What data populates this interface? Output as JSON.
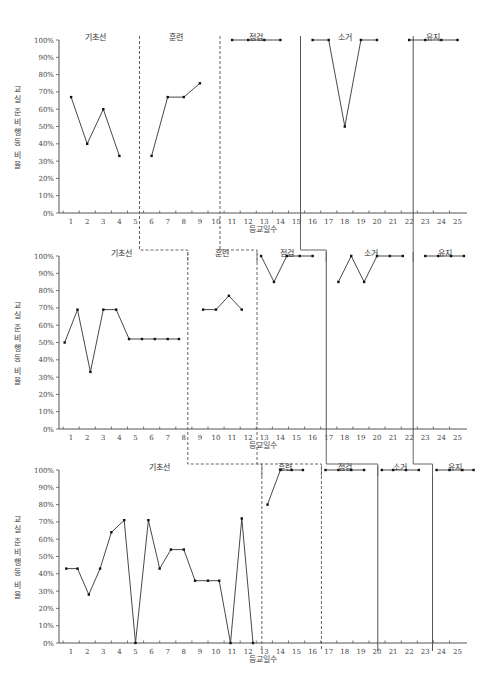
{
  "chart_data": [
    {
      "type": "line",
      "title": "",
      "ylabel": "교실 준비행동 비율",
      "xlabel": "등교일수",
      "ylim": [
        0,
        100
      ],
      "yticks": [
        "0%",
        "10%",
        "20%",
        "30%",
        "40%",
        "50%",
        "60%",
        "70%",
        "80%",
        "90%",
        "100%"
      ],
      "xticks": [
        1,
        2,
        3,
        4,
        5,
        6,
        7,
        8,
        9,
        10,
        11,
        12,
        13,
        14,
        15,
        16,
        17,
        18,
        19,
        20,
        21,
        22,
        23,
        24,
        25
      ],
      "phases": [
        {
          "label": "기초선",
          "x": [
            1,
            2,
            3,
            4
          ],
          "values": [
            67,
            40,
            60,
            33
          ]
        },
        {
          "label": "훈련",
          "x": [
            6,
            7,
            8,
            9
          ],
          "values": [
            33,
            67,
            67,
            75
          ]
        },
        {
          "label": "점검",
          "x": [
            11,
            12,
            13,
            14
          ],
          "values": [
            100,
            100,
            100,
            100
          ]
        },
        {
          "label": "소거",
          "x": [
            16,
            17,
            18,
            19,
            20
          ],
          "values": [
            100,
            100,
            50,
            100,
            100
          ]
        },
        {
          "label": "유지",
          "x": [
            22,
            23,
            24,
            25
          ],
          "values": [
            100,
            100,
            100,
            100
          ]
        }
      ],
      "phase_boundaries": [
        5,
        10,
        15,
        22
      ]
    },
    {
      "type": "line",
      "title": "",
      "ylabel": "교실 준비행동 비율",
      "xlabel": "등교일수",
      "ylim": [
        0,
        100
      ],
      "yticks": [
        "0%",
        "10%",
        "20%",
        "30%",
        "40%",
        "50%",
        "60%",
        "70%",
        "80%",
        "90%",
        "100%"
      ],
      "xticks": [
        1,
        2,
        3,
        4,
        5,
        6,
        7,
        8,
        9,
        10,
        11,
        12,
        13,
        14,
        15,
        16,
        17,
        18,
        19,
        20,
        21,
        22,
        23,
        24,
        25
      ],
      "phases": [
        {
          "label": "기초선",
          "x": [
            0.6,
            1.4,
            2.2,
            3.0,
            3.8,
            4.6,
            5.4,
            6.2,
            7.0,
            7.7
          ],
          "values": [
            50,
            69,
            33,
            69,
            69,
            52,
            52,
            52,
            52,
            52
          ]
        },
        {
          "label": "훈련",
          "x": [
            9.2,
            10.0,
            10.8,
            11.6
          ],
          "values": [
            69,
            69,
            77,
            69
          ]
        },
        {
          "label": "점검",
          "x": [
            12.8,
            13.6,
            14.4,
            15.2,
            16.0
          ],
          "values": [
            100,
            85,
            100,
            100,
            100
          ]
        },
        {
          "label": "소거",
          "x": [
            17.6,
            18.4,
            19.2,
            20.0,
            20.8,
            21.6
          ],
          "values": [
            85,
            100,
            85,
            100,
            100,
            100
          ]
        },
        {
          "label": "유지",
          "x": [
            23.0,
            23.8,
            24.6,
            25.4
          ],
          "values": [
            100,
            100,
            100,
            100
          ]
        }
      ],
      "phase_boundaries": [
        8,
        12.3,
        16.6,
        22
      ]
    },
    {
      "type": "line",
      "title": "",
      "ylabel": "교실 준비행동 비율",
      "xlabel": "등교일수",
      "ylim": [
        0,
        100
      ],
      "yticks": [
        "0%",
        "10%",
        "20%",
        "30%",
        "40%",
        "50%",
        "60%",
        "70%",
        "80%",
        "90%",
        "100%"
      ],
      "xticks": [
        1,
        2,
        3,
        4,
        5,
        6,
        7,
        8,
        9,
        10,
        11,
        12,
        13,
        14,
        15,
        16,
        17,
        18,
        19,
        20,
        21,
        22,
        23,
        24,
        25
      ],
      "phases": [
        {
          "label": "기초선",
          "x": [
            0.7,
            1.4,
            2.1,
            2.8,
            3.5,
            4.3,
            5.0,
            5.8,
            6.5,
            7.2,
            8.0,
            8.7,
            9.5,
            10.2,
            10.9,
            11.6,
            12.3
          ],
          "values": [
            43,
            43,
            28,
            43,
            64,
            71,
            0,
            71,
            43,
            54,
            54,
            36,
            36,
            36,
            0,
            72,
            0
          ]
        },
        {
          "label": "훈련",
          "x": [
            13.2,
            14.0,
            14.7,
            15.4
          ],
          "values": [
            80,
            100,
            100,
            100
          ]
        },
        {
          "label": "점검",
          "x": [
            16.8,
            17.6,
            18.4,
            19.2
          ],
          "values": [
            100,
            100,
            100,
            100
          ]
        },
        {
          "label": "소거",
          "x": [
            20.3,
            21.0,
            21.8,
            22.6
          ],
          "values": [
            100,
            100,
            100,
            100
          ]
        },
        {
          "label": "유지",
          "x": [
            23.7,
            24.5,
            25.3,
            26.0
          ],
          "values": [
            100,
            100,
            100,
            100
          ]
        }
      ],
      "phase_boundaries": [
        12.6,
        16.3,
        19.8,
        23.2
      ]
    }
  ],
  "labels": {
    "ylabel_chars": [
      "교",
      "실",
      "준",
      "비",
      "행",
      "동",
      "비",
      "율"
    ],
    "xlabel": "등교일수"
  }
}
